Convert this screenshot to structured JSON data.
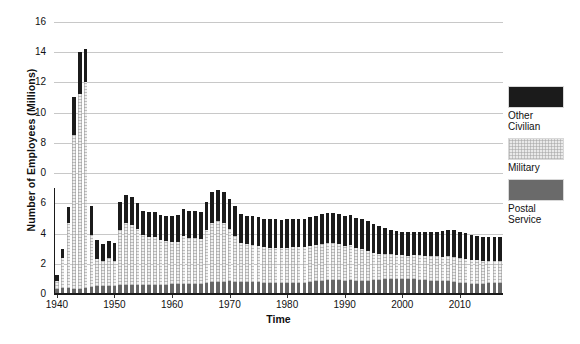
{
  "chart_data": {
    "type": "bar",
    "stacked": true,
    "title": "",
    "xlabel": "Time",
    "ylabel": "Number of Employees (Millions)",
    "ylim": [
      0,
      16
    ],
    "xlim": [
      1939,
      2018
    ],
    "grid": true,
    "legend_position": "right",
    "ytick_labels": [
      "16",
      "14",
      "12",
      "10",
      "8",
      "0",
      "6",
      "4",
      "2",
      "0"
    ],
    "ytick_values": [
      16,
      14,
      12,
      10,
      8,
      7,
      6,
      4,
      2,
      0
    ],
    "xtick_labels": [
      "1940",
      "1950",
      "1960",
      "1970",
      "1980",
      "1990",
      "2000",
      "2010"
    ],
    "xtick_values": [
      1940,
      1950,
      1960,
      1970,
      1980,
      1990,
      2000,
      2010
    ],
    "series": [
      {
        "name": "Postal Service",
        "color": "#666666",
        "values": [
          0.32,
          0.33,
          0.33,
          0.32,
          0.31,
          0.33,
          0.43,
          0.48,
          0.49,
          0.49,
          0.5,
          0.51,
          0.51,
          0.52,
          0.52,
          0.52,
          0.52,
          0.53,
          0.54,
          0.55,
          0.56,
          0.58,
          0.59,
          0.59,
          0.6,
          0.6,
          0.65,
          0.7,
          0.72,
          0.73,
          0.74,
          0.72,
          0.7,
          0.69,
          0.71,
          0.7,
          0.67,
          0.66,
          0.67,
          0.67,
          0.67,
          0.66,
          0.66,
          0.67,
          0.7,
          0.74,
          0.78,
          0.8,
          0.82,
          0.8,
          0.79,
          0.82,
          0.79,
          0.78,
          0.79,
          0.81,
          0.84,
          0.87,
          0.89,
          0.9,
          0.89,
          0.87,
          0.86,
          0.84,
          0.8,
          0.79,
          0.78,
          0.77,
          0.76,
          0.71,
          0.67,
          0.64,
          0.61,
          0.61,
          0.61,
          0.62,
          0.62,
          0.62
        ]
      },
      {
        "name": "Military",
        "color": "#efefef",
        "values": [
          0.46,
          1.8,
          3.86,
          9.04,
          11.45,
          12.12,
          3.03,
          1.58,
          1.45,
          1.62,
          1.46,
          3.25,
          3.64,
          3.56,
          3.3,
          2.94,
          2.81,
          2.8,
          2.64,
          2.55,
          2.48,
          2.48,
          2.81,
          2.7,
          2.69,
          2.66,
          3.09,
          3.45,
          3.55,
          3.46,
          3.07,
          2.71,
          2.33,
          2.25,
          2.16,
          2.13,
          2.08,
          2.07,
          2.06,
          2.03,
          2.05,
          2.08,
          2.11,
          2.11,
          2.14,
          2.15,
          2.18,
          2.19,
          2.17,
          2.13,
          2.04,
          2.04,
          1.91,
          1.85,
          1.73,
          1.62,
          1.52,
          1.47,
          1.44,
          1.41,
          1.38,
          1.38,
          1.41,
          1.43,
          1.43,
          1.43,
          1.43,
          1.43,
          1.45,
          1.48,
          1.43,
          1.43,
          1.4,
          1.37,
          1.35,
          1.34,
          1.34,
          1.34
        ]
      },
      {
        "name": "Other Civilian",
        "color": "#1b1b1b",
        "values": [
          0.31,
          0.5,
          0.95,
          2.25,
          2.5,
          1.94,
          1.71,
          1.09,
          0.99,
          1.0,
          1.07,
          1.67,
          1.7,
          1.63,
          1.55,
          1.45,
          1.47,
          1.48,
          1.48,
          1.48,
          1.54,
          1.58,
          1.59,
          1.59,
          1.58,
          1.57,
          1.69,
          1.85,
          1.82,
          1.8,
          1.78,
          1.72,
          1.69,
          1.66,
          1.7,
          1.69,
          1.66,
          1.67,
          1.68,
          1.66,
          1.7,
          1.65,
          1.65,
          1.66,
          1.69,
          1.71,
          1.74,
          1.75,
          1.76,
          1.76,
          1.76,
          1.79,
          1.8,
          1.79,
          1.75,
          1.7,
          1.62,
          1.53,
          1.46,
          1.42,
          1.39,
          1.37,
          1.36,
          1.36,
          1.39,
          1.44,
          1.46,
          1.51,
          1.56,
          1.58,
          1.54,
          1.5,
          1.46,
          1.43,
          1.41,
          1.4,
          1.39,
          1.38
        ]
      }
    ],
    "x": [
      1940,
      1941,
      1942,
      1943,
      1944,
      1945,
      1946,
      1947,
      1948,
      1949,
      1950,
      1951,
      1952,
      1953,
      1954,
      1955,
      1956,
      1957,
      1958,
      1959,
      1960,
      1961,
      1962,
      1963,
      1964,
      1965,
      1966,
      1967,
      1968,
      1969,
      1970,
      1971,
      1972,
      1973,
      1974,
      1975,
      1976,
      1977,
      1978,
      1979,
      1980,
      1981,
      1982,
      1983,
      1984,
      1985,
      1986,
      1987,
      1988,
      1989,
      1990,
      1991,
      1992,
      1993,
      1994,
      1995,
      1996,
      1997,
      1998,
      1999,
      2000,
      2001,
      2002,
      2003,
      2004,
      2005,
      2006,
      2007,
      2008,
      2009,
      2010,
      2011,
      2012,
      2013,
      2014,
      2015,
      2016,
      2017
    ]
  },
  "legend": {
    "items": [
      {
        "label": "Other\nCivilian",
        "swatch": "other"
      },
      {
        "label": "Military",
        "swatch": "mil"
      },
      {
        "label": "Postal\nService",
        "swatch": "post"
      }
    ]
  },
  "axes": {
    "y_title": "Number of Employees (Millions)",
    "x_title": "Time"
  },
  "colors": {
    "other_civilian": "#1b1b1b",
    "military": "#efefef",
    "postal_service": "#666666",
    "gridline": "#c8c8c8",
    "axis": "#1a1a1a"
  }
}
